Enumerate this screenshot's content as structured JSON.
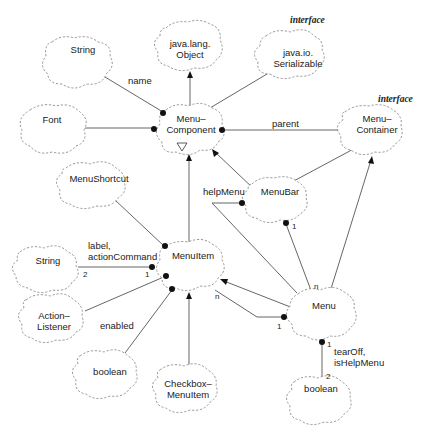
{
  "diagram": {
    "type": "class-diagram",
    "nodes": {
      "string_top": "String",
      "object": "java.lang.\nObject",
      "serializable": "java.io.\nSerializable",
      "font": "Font",
      "menucomponent": "Menu–\nComponent",
      "menucontainer": "Menu–\nContainer",
      "menushortcut": "MenuShortcut",
      "menubar": "MenuBar",
      "string_mid": "String",
      "menuitem": "MenuItem",
      "actionlistener": "Action–\nListener",
      "boolean_left": "boolean",
      "checkbox": "Checkbox–\nMenuItem",
      "menu": "Menu",
      "boolean_right": "boolean"
    },
    "stereotypes": {
      "serializable": "interface",
      "menucontainer": "interface"
    },
    "abstract_marker": "A",
    "roles": {
      "name": "name",
      "parent": "parent",
      "helpMenu": "helpMenu",
      "label_actionCommand": "label,\nactionCommand",
      "enabled": "enabled",
      "tearOff_isHelpMenu": "tearOff,\nisHelpMenu"
    },
    "multiplicities": {
      "string_mid_2": "2",
      "menuitem_1": "1",
      "menubar_1": "1",
      "menu_n_top": "n",
      "menuitem_n": "n",
      "menu_1": "1",
      "menu_bool_1": "1",
      "bool_2": "2"
    }
  }
}
